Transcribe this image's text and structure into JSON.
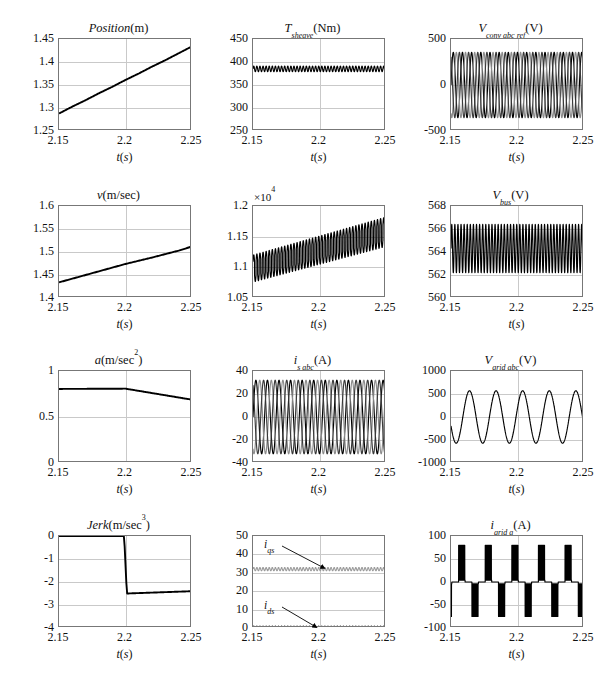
{
  "figure": {
    "rows": 4,
    "cols": 3,
    "background": "#ffffff",
    "trace_colors": {
      "phase_a": "#000000",
      "phase_b": "#808080",
      "phase_c": "#3a3a3a",
      "primary": "#000000",
      "secondary": "#9a9a9a"
    },
    "grid_color": "#c9c9c9",
    "axis_color": "#777777",
    "xlabel_common": "t(s)"
  },
  "chart_data": [
    {
      "id": "position",
      "type": "line",
      "title": "Position (m)",
      "title_parts": {
        "main": "Position",
        "unit": "(m)"
      },
      "xlabel": "t(s)",
      "ylabel": "",
      "xlim": [
        2.15,
        2.25
      ],
      "ylim": [
        1.25,
        1.45
      ],
      "xticks": [
        2.15,
        2.2,
        2.25
      ],
      "xticklabels": [
        "2.15",
        "2.2",
        "2.25"
      ],
      "yticks": [
        1.25,
        1.3,
        1.35,
        1.4,
        1.45
      ],
      "yticklabels": [
        "1.25",
        "1.3",
        "1.35",
        "1.4",
        "1.45"
      ],
      "grid": true,
      "series": [
        {
          "name": "position",
          "color": "#000000",
          "x": [
            2.15,
            2.16,
            2.17,
            2.18,
            2.19,
            2.2,
            2.21,
            2.22,
            2.23,
            2.24,
            2.25
          ],
          "values": [
            1.288,
            1.303,
            1.317,
            1.332,
            1.346,
            1.361,
            1.375,
            1.39,
            1.404,
            1.419,
            1.434
          ]
        }
      ]
    },
    {
      "id": "t_sheave",
      "type": "line",
      "title": "T_sheave(Nm)",
      "title_parts": {
        "main": "T",
        "sub": "sheave",
        "unit": "(Nm)"
      },
      "xlabel": "t(s)",
      "xlim": [
        2.15,
        2.25
      ],
      "ylim": [
        250,
        450
      ],
      "xticks": [
        2.15,
        2.2,
        2.25
      ],
      "xticklabels": [
        "2.15",
        "2.2",
        "2.25"
      ],
      "yticks": [
        250,
        300,
        350,
        400,
        450
      ],
      "yticklabels": [
        "250",
        "300",
        "350",
        "400",
        "450"
      ],
      "grid": true,
      "series": [
        {
          "name": "T_sheave",
          "color": "#000000",
          "mean": 385,
          "ripple_amplitude": 6,
          "ripple_freq_hz": 430
        }
      ]
    },
    {
      "id": "v_conv_abc_ref",
      "type": "line",
      "title": "V_conv abc ref (V)",
      "title_parts": {
        "main": "V",
        "sub": "conv abc ref",
        "unit": "(V)"
      },
      "xlabel": "t(s)",
      "xlim": [
        2.15,
        2.25
      ],
      "ylim": [
        -500,
        500
      ],
      "xticks": [
        2.15,
        2.2,
        2.25
      ],
      "xticklabels": [
        "2.15",
        "2.2",
        "2.25"
      ],
      "yticks": [
        -500,
        0,
        500
      ],
      "yticklabels": [
        "-500",
        "0",
        "500"
      ],
      "grid": true,
      "series": [
        {
          "name": "phase a",
          "color": "#000000",
          "amplitude": 355,
          "freq_hz": 145,
          "phase_deg": 0
        },
        {
          "name": "phase b",
          "color": "#8c8c8c",
          "amplitude": 355,
          "freq_hz": 145,
          "phase_deg": -120
        },
        {
          "name": "phase c",
          "color": "#3a3a3a",
          "amplitude": 355,
          "freq_hz": 145,
          "phase_deg": 120
        }
      ]
    },
    {
      "id": "velocity",
      "type": "line",
      "title": "v(m/sec)",
      "title_parts": {
        "main": "v",
        "unit": "(m/sec)"
      },
      "xlabel": "t(s)",
      "xlim": [
        2.15,
        2.25
      ],
      "ylim": [
        1.4,
        1.6
      ],
      "xticks": [
        2.15,
        2.2,
        2.25
      ],
      "xticklabels": [
        "2.15",
        "2.2",
        "2.25"
      ],
      "yticks": [
        1.4,
        1.45,
        1.5,
        1.55,
        1.6
      ],
      "yticklabels": [
        "1.4",
        "1.45",
        "1.5",
        "1.55",
        "1.6"
      ],
      "grid": true,
      "series": [
        {
          "name": "velocity",
          "color": "#000000",
          "x": [
            2.15,
            2.17,
            2.19,
            2.2,
            2.22,
            2.24,
            2.25
          ],
          "values": [
            1.434,
            1.45,
            1.466,
            1.474,
            1.488,
            1.503,
            1.512
          ]
        }
      ]
    },
    {
      "id": "p_m",
      "type": "line",
      "title": "P_m(W)",
      "title_parts": {
        "main": "P",
        "sub": "m",
        "unit": "(W)"
      },
      "exponent_label": "×10⁴",
      "xlabel": "t(s)",
      "xlim": [
        2.15,
        2.25
      ],
      "ylim": [
        1.05,
        1.2
      ],
      "xticks": [
        2.15,
        2.2,
        2.25
      ],
      "xticklabels": [
        "2.15",
        "2.2",
        "2.25"
      ],
      "yticks": [
        1.05,
        1.1,
        1.15,
        1.2
      ],
      "yticklabels": [
        "1.05",
        "1.1",
        "1.15",
        "1.2"
      ],
      "grid": true,
      "series": [
        {
          "name": "P_m",
          "color": "#000000",
          "trend_start": 1.098,
          "trend_end": 1.158,
          "ripple_amplitude_start": 0.022,
          "ripple_amplitude_end": 0.024,
          "ripple_freq_hz": 430
        }
      ]
    },
    {
      "id": "v_bus",
      "type": "line",
      "title": "V_bus(V)",
      "title_parts": {
        "main": "V",
        "sub": "bus",
        "unit": "(V)"
      },
      "xlabel": "t(s)",
      "xlim": [
        2.15,
        2.25
      ],
      "ylim": [
        560,
        568
      ],
      "xticks": [
        2.15,
        2.2,
        2.25
      ],
      "xticklabels": [
        "2.15",
        "2.2",
        "2.25"
      ],
      "yticks": [
        560,
        562,
        564,
        566,
        568
      ],
      "yticklabels": [
        "560",
        "562",
        "564",
        "566",
        "568"
      ],
      "grid": true,
      "series": [
        {
          "name": "V_bus",
          "color": "#000000",
          "mean": 564.3,
          "ripple_amplitude": 2.1,
          "ripple_freq_hz": 430
        }
      ]
    },
    {
      "id": "acceleration",
      "type": "line",
      "title": "a(m/sec^2)",
      "title_parts": {
        "main": "a",
        "unit": "(m/sec",
        "sup": "2",
        "unit_end": ")"
      },
      "xlabel": "t(s)",
      "xlim": [
        2.15,
        2.25
      ],
      "ylim": [
        0,
        1
      ],
      "xticks": [
        2.15,
        2.2,
        2.25
      ],
      "xticklabels": [
        "2.15",
        "2.2",
        "2.25"
      ],
      "yticks": [
        0,
        0.5,
        1
      ],
      "yticklabels": [
        "0",
        "0.5",
        "1"
      ],
      "grid": true,
      "series": [
        {
          "name": "acceleration",
          "color": "#000000",
          "x": [
            2.15,
            2.2,
            2.25
          ],
          "values": [
            0.805,
            0.808,
            0.688
          ]
        }
      ]
    },
    {
      "id": "i_s_abc",
      "type": "line",
      "title": "i_s abc(A)",
      "title_parts": {
        "main": "i",
        "sub": "s abc",
        "unit": "(A)"
      },
      "xlabel": "t(s)",
      "xlim": [
        2.15,
        2.25
      ],
      "ylim": [
        -40,
        40
      ],
      "xticks": [
        2.15,
        2.2,
        2.25
      ],
      "xticklabels": [
        "2.15",
        "2.2",
        "2.25"
      ],
      "yticks": [
        -40,
        -20,
        0,
        20,
        40
      ],
      "yticklabels": [
        "-40",
        "-20",
        "0",
        "20",
        "40"
      ],
      "grid": true,
      "series": [
        {
          "name": "phase a",
          "color": "#000000",
          "amplitude": 32,
          "freq_hz": 115,
          "phase_deg": 0
        },
        {
          "name": "phase b",
          "color": "#8c8c8c",
          "amplitude": 32,
          "freq_hz": 115,
          "phase_deg": -120
        },
        {
          "name": "phase c",
          "color": "#3a3a3a",
          "amplitude": 32,
          "freq_hz": 115,
          "phase_deg": 120
        }
      ]
    },
    {
      "id": "v_grid_abc",
      "type": "line",
      "title": "V_grid abc(V)",
      "title_parts": {
        "main": "V",
        "sub": "grid abc",
        "unit": "(V)"
      },
      "xlabel": "t(s)",
      "xlim": [
        2.15,
        2.25
      ],
      "ylim": [
        -1000,
        1000
      ],
      "xticks": [
        2.15,
        2.2,
        2.25
      ],
      "xticklabels": [
        "2.15",
        "2.2",
        "2.25"
      ],
      "yticks": [
        -1000,
        -500,
        0,
        500,
        1000
      ],
      "yticklabels": [
        "-1000",
        "-500",
        "0",
        "500",
        "1000"
      ],
      "grid": true,
      "series": [
        {
          "name": "grid voltage",
          "color": "#000000",
          "amplitude": 570,
          "freq_hz": 50,
          "phase_deg": -160
        }
      ]
    },
    {
      "id": "jerk",
      "type": "line",
      "title": "Jerk (m/sec^3)",
      "title_parts": {
        "main": "Jerk",
        "unit": "(m/sec",
        "sup": "3",
        "unit_end": ")"
      },
      "xlabel": "t(s)",
      "xlim": [
        2.15,
        2.25
      ],
      "ylim": [
        -4,
        0
      ],
      "xticks": [
        2.15,
        2.2,
        2.25
      ],
      "xticklabels": [
        "2.15",
        "2.2",
        "2.25"
      ],
      "yticks": [
        -4,
        -3,
        -2,
        -1,
        0
      ],
      "yticklabels": [
        "-4",
        "-3",
        "-2",
        "-1",
        "0"
      ],
      "grid": true,
      "series": [
        {
          "name": "jerk",
          "color": "#000000",
          "x": [
            2.15,
            2.199,
            2.201,
            2.25
          ],
          "values": [
            0.0,
            0.0,
            -2.5,
            -2.4
          ]
        }
      ]
    },
    {
      "id": "i_dq",
      "type": "line",
      "title": "",
      "xlabel": "t(s)",
      "xlim": [
        2.15,
        2.25
      ],
      "ylim": [
        0,
        50
      ],
      "xticks": [
        2.15,
        2.2,
        2.25
      ],
      "xticklabels": [
        "2.15",
        "2.2",
        "2.25"
      ],
      "yticks": [
        0,
        10,
        20,
        30,
        40,
        50
      ],
      "yticklabels": [
        "0",
        "10",
        "20",
        "30",
        "40",
        "50"
      ],
      "grid": true,
      "annotations": [
        {
          "label": "i_qs",
          "label_main": "i",
          "label_sub": "qs",
          "points_to": 32
        },
        {
          "label": "i_ds",
          "label_main": "i",
          "label_sub": "ds",
          "points_to": 0
        }
      ],
      "series": [
        {
          "name": "i_qs",
          "color": "#9a9a9a",
          "mean": 32.0,
          "ripple_amplitude": 0.9,
          "ripple_freq_hz": 430
        },
        {
          "name": "i_ds",
          "color": "#000000",
          "mean": 0.0,
          "ripple_amplitude": 1.0,
          "ripple_freq_hz": 430
        }
      ]
    },
    {
      "id": "i_grid_a",
      "type": "line",
      "title": "i_grid a(A)",
      "title_parts": {
        "main": "i",
        "sub": "grid a",
        "unit": "(A)"
      },
      "xlabel": "t(s)",
      "xlim": [
        2.15,
        2.25
      ],
      "ylim": [
        -100,
        100
      ],
      "xticks": [
        2.15,
        2.2,
        2.25
      ],
      "xticklabels": [
        "2.15",
        "2.2",
        "2.25"
      ],
      "yticks": [
        -100,
        -50,
        0,
        50,
        100
      ],
      "yticklabels": [
        "-100",
        "-50",
        "0",
        "50",
        "100"
      ],
      "grid": true,
      "series": [
        {
          "name": "i_grid a",
          "color": "#000000",
          "pulse_peak_positive": 80,
          "pulse_peak_negative": -75,
          "fundamental_freq_hz": 50,
          "waveform": "pulsed-rectifier-current"
        }
      ]
    }
  ]
}
